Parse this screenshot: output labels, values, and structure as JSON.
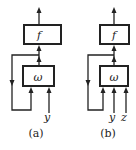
{
  "diagrams": [
    {
      "id": "a",
      "caption": "(a)",
      "output_block": "f",
      "memory_block": "ω",
      "inputs": [
        "y"
      ]
    },
    {
      "id": "b",
      "caption": "(b)",
      "output_block": "f",
      "memory_block": "ω",
      "inputs": [
        "y",
        "z"
      ]
    }
  ],
  "colors": {
    "stroke": "#222222",
    "background": "#ffffff"
  }
}
